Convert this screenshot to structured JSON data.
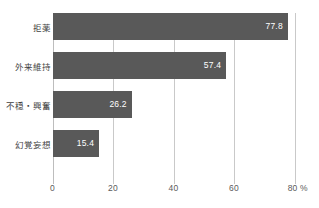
{
  "chart_data": {
    "type": "bar",
    "orientation": "horizontal",
    "title": "",
    "xlabel": "%",
    "ylabel": "",
    "categories": [
      "拒薬",
      "外来維持",
      "不穏・興奮",
      "幻覚妄想"
    ],
    "values": [
      77.8,
      57.4,
      26.2,
      15.4
    ],
    "value_labels": [
      "77.8",
      "57.4",
      "26.2",
      "15.4"
    ],
    "xlim": [
      0,
      80
    ],
    "xticks": [
      0,
      20,
      40,
      60,
      80
    ],
    "xtick_labels": [
      "0",
      "20",
      "40",
      "60",
      "80 %"
    ],
    "grid": true,
    "legend": false,
    "bar_color": "#595959",
    "value_label_color": "#ffffff",
    "gridline_color": "#c9c9c9",
    "axis_text_color": "#5a5a5a",
    "background_color": "#ffffff"
  }
}
